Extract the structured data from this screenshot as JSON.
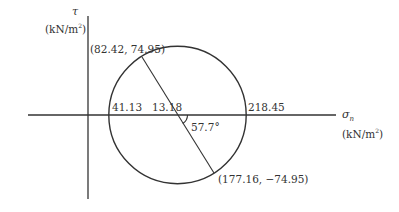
{
  "diagram": {
    "type": "mohr-circle",
    "vertical_axis": {
      "symbol": "τ",
      "unit_prefix": "(kN/m",
      "unit_exp": "2",
      "unit_suffix": ")"
    },
    "horizontal_axis": {
      "symbol": "σ",
      "symbol_sub": "n",
      "unit_prefix": "(kN/m",
      "unit_exp": "2",
      "unit_suffix": ")"
    },
    "labels": {
      "point_top": "(82.42,  74.95)",
      "point_bottom": "(177.16,  −74.95)",
      "sigma_min": "41.13",
      "sigma_max": "218.45",
      "center_tau": "13.18",
      "angle": "57.7°"
    },
    "values": {
      "sigma_min": 41.13,
      "sigma_max": 218.45,
      "point_top": [
        82.42,
        74.95
      ],
      "point_bottom": [
        177.16,
        -74.95
      ],
      "angle_deg": 57.7
    },
    "colors": {
      "line": "#333333",
      "background": "#ffffff"
    }
  }
}
